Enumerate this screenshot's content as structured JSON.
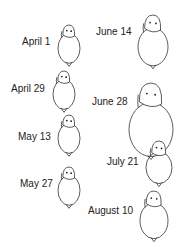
{
  "diagram": {
    "type": "growth-sequence",
    "stages": [
      {
        "label": "April 1",
        "x": 22,
        "y": 36,
        "fx": 58,
        "fy": 24,
        "w": 22,
        "h": 44,
        "body_rx": 11,
        "body_ry": 15
      },
      {
        "label": "April 29",
        "x": 11,
        "y": 83,
        "fx": 53,
        "fy": 70,
        "w": 22,
        "h": 44,
        "body_rx": 11,
        "body_ry": 15
      },
      {
        "label": "May 13",
        "x": 18,
        "y": 131,
        "fx": 58,
        "fy": 114,
        "w": 22,
        "h": 44,
        "body_rx": 11,
        "body_ry": 15
      },
      {
        "label": "May 27",
        "x": 20,
        "y": 178,
        "fx": 58,
        "fy": 166,
        "w": 22,
        "h": 44,
        "body_rx": 11,
        "body_ry": 15
      },
      {
        "label": "June 14",
        "x": 96,
        "y": 26,
        "fx": 138,
        "fy": 14,
        "w": 30,
        "h": 56,
        "body_rx": 15,
        "body_ry": 19
      },
      {
        "label": "June 28",
        "x": 92,
        "y": 96,
        "fx": 130,
        "fy": 82,
        "w": 42,
        "h": 76,
        "body_rx": 22,
        "body_ry": 27
      },
      {
        "label": "July 21",
        "x": 107,
        "y": 156,
        "fx": 146,
        "fy": 140,
        "w": 26,
        "h": 48,
        "body_rx": 13,
        "body_ry": 16
      },
      {
        "label": "August 10",
        "x": 88,
        "y": 205,
        "fx": 140,
        "fy": 190,
        "w": 28,
        "h": 52,
        "body_rx": 14,
        "body_ry": 18
      }
    ]
  }
}
